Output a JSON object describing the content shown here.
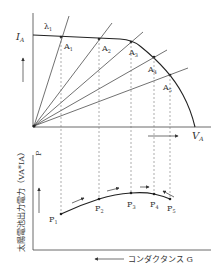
{
  "top_plot": {
    "y_axis_label": "I",
    "y_axis_sub": "A",
    "x_axis_label": "V",
    "x_axis_sub": "A",
    "lambda_label": "λ",
    "lambda_sub": "1",
    "operating_points": [
      {
        "label": "A",
        "sub": "1"
      },
      {
        "label": "A",
        "sub": "2"
      },
      {
        "label": "A",
        "sub": "3"
      },
      {
        "label": "A",
        "sub": "4"
      },
      {
        "label": "A",
        "sub": "5"
      }
    ]
  },
  "bottom_plot": {
    "y_axis_label": "太陽電池出力電力（V",
    "y_axis_label_full": "太陽電池出力電力（VA*IA）",
    "y_short": "P",
    "x_axis_label": "コンダクタンス G",
    "power_points": [
      {
        "label": "P",
        "sub": "1"
      },
      {
        "label": "P",
        "sub": "2"
      },
      {
        "label": "P",
        "sub": "3"
      },
      {
        "label": "P",
        "sub": "4"
      },
      {
        "label": "P",
        "sub": "5"
      }
    ]
  },
  "colors": {
    "line": "#333333",
    "dashed": "#777777",
    "text": "#444444"
  }
}
